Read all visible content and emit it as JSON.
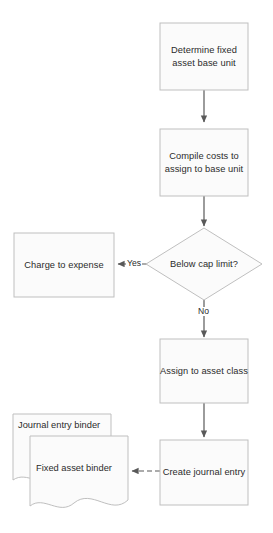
{
  "diagram": {
    "colors": {
      "shape_fill": "#fbfbfb",
      "shape_stroke": "#bfbfbf",
      "connector": "#595959",
      "text": "#2b2b2b",
      "background": "#ffffff"
    },
    "nodes": [
      {
        "id": "determine-fixed-asset-base-unit",
        "type": "process",
        "label": "Determine fixed asset base unit",
        "line1": "Determine fixed",
        "line2": "asset base unit"
      },
      {
        "id": "compile-costs-to-assign-to-base-unit",
        "type": "process",
        "label": "Compile costs to assign to base unit",
        "line1": "Compile costs to",
        "line2": "assign to base unit"
      },
      {
        "id": "below-cap-limit",
        "type": "decision",
        "label": "Below cap limit?"
      },
      {
        "id": "charge-to-expense",
        "type": "process",
        "label": "Charge to expense"
      },
      {
        "id": "assign-to-asset-class",
        "type": "process",
        "label": "Assign to asset class"
      },
      {
        "id": "create-journal-entry",
        "type": "process",
        "label": "Create journal entry"
      },
      {
        "id": "journal-entry-binder",
        "type": "document",
        "label": "Journal entry binder"
      },
      {
        "id": "fixed-asset-binder",
        "type": "document",
        "label": "Fixed asset binder"
      }
    ],
    "edges": [
      {
        "id": "edge-determine-to-compile",
        "from": "determine-fixed-asset-base-unit",
        "to": "compile-costs-to-assign-to-base-unit",
        "label": "",
        "style": "solid"
      },
      {
        "id": "edge-compile-to-decision",
        "from": "compile-costs-to-assign-to-base-unit",
        "to": "below-cap-limit",
        "label": "",
        "style": "solid"
      },
      {
        "id": "edge-decision-yes",
        "from": "below-cap-limit",
        "to": "charge-to-expense",
        "label": "Yes",
        "style": "solid"
      },
      {
        "id": "edge-decision-no",
        "from": "below-cap-limit",
        "to": "assign-to-asset-class",
        "label": "No",
        "style": "solid"
      },
      {
        "id": "edge-assign-to-journal",
        "from": "assign-to-asset-class",
        "to": "create-journal-entry",
        "label": "",
        "style": "solid"
      },
      {
        "id": "edge-journal-to-binder",
        "from": "create-journal-entry",
        "to": "fixed-asset-binder",
        "label": "",
        "style": "dashed"
      }
    ]
  }
}
